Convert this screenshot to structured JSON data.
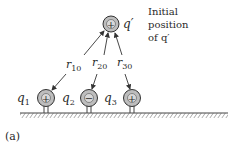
{
  "figure": {
    "panel_label": "(a)",
    "annotation": {
      "line1": "Initial",
      "line2": "position",
      "line3": "of q′"
    },
    "test_charge": {
      "name": "q′",
      "sign": "+"
    },
    "charges": [
      {
        "name": "q",
        "sub": "1",
        "sign": "+"
      },
      {
        "name": "q",
        "sub": "2",
        "sign": "−"
      },
      {
        "name": "q",
        "sub": "3",
        "sign": "+"
      }
    ],
    "distances": [
      {
        "name": "r",
        "sub": "10"
      },
      {
        "name": "r",
        "sub": "20"
      },
      {
        "name": "r",
        "sub": "30"
      }
    ],
    "colors": {
      "charge_fill": "#bdbdbd",
      "stroke": "#333333",
      "ground_hatch": "#555555"
    }
  }
}
